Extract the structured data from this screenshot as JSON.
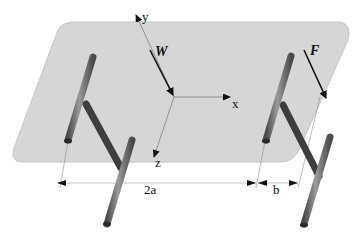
{
  "diagram": {
    "axes": {
      "x_label": "x",
      "y_label": "y",
      "z_label": "z"
    },
    "forces": {
      "W_label": "W",
      "F_label": "F"
    },
    "dimensions": {
      "span_label": "2a",
      "offset_label": "b"
    },
    "colors": {
      "plane_fill": "#d4d4d4",
      "plane_edge": "#b8b8b8",
      "tube_dark": "#4a4a4a",
      "tube_mid": "#7a7a7a",
      "tube_light": "#a8a8a8",
      "arrow": "#111111",
      "guide_line": "#888888"
    }
  }
}
